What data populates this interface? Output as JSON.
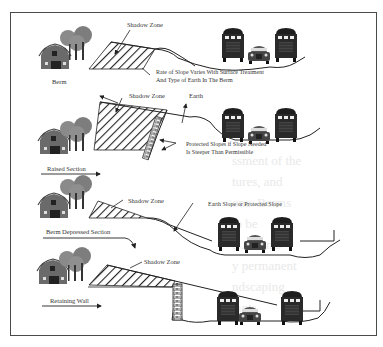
{
  "diagram": {
    "panels": [
      {
        "id": "berm",
        "section_label": "Berm",
        "shadow_label": "Shadow Zone",
        "note_lines": [
          "Rate of Slope Varies With Surface Treatment",
          "And Type of Earth In The Berm"
        ]
      },
      {
        "id": "raised",
        "section_label": "Raised Section",
        "shadow_label": "Shadow Zone",
        "earth_label": "Earth",
        "note_lines": [
          "Protected Slopes if Slope Needed",
          "Is Steeper Than Permissible"
        ]
      },
      {
        "id": "berm-depressed",
        "section_label": "Berm Depressed Section",
        "shadow_label": "Shadow Zone",
        "note_lines": [
          "Earth  Slope or Protected Slope"
        ]
      },
      {
        "id": "retaining-wall",
        "section_label": "Retaining Wall",
        "shadow_label": "Shadow Zone"
      }
    ],
    "icons": {
      "house": "barn-house-icon",
      "trees": "tree-cluster-icon",
      "vehicle_large": "truck-front-icon",
      "vehicle_small": "car-front-icon",
      "wall": "retaining-wall-icon"
    },
    "colors": {
      "line": "#222222",
      "frame": "#4a4a4a",
      "house": "#666666",
      "tree": "#8a8a8a",
      "hatch": "#222222",
      "text": "#333333"
    },
    "background_text": [
      "ssment of the",
      "tures, and",
      "one. Berms",
      "to be",
      "ts. Berms",
      "y permanent",
      "ndscaping",
      "lants"
    ]
  }
}
